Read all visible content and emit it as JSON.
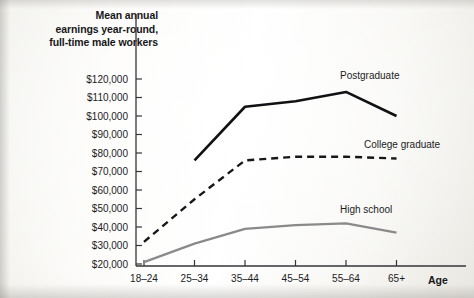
{
  "chart_data": {
    "type": "line",
    "title": "Mean annual earnings year-round, full-time male workers",
    "title_lines": [
      "Mean annual",
      "earnings year-round,",
      "full-time male workers"
    ],
    "xlabel": "Age",
    "ylabel": "",
    "categories": [
      "18–24",
      "25–34",
      "35–44",
      "45–54",
      "55–64",
      "65+"
    ],
    "ytick_labels": [
      "$120,000",
      "$110,000",
      "$100,000",
      "$90,000",
      "$80,000",
      "$70,000",
      "$60,000",
      "$50,000",
      "$40,000",
      "$30,000",
      "$20,000"
    ],
    "ytick_values": [
      120000,
      110000,
      100000,
      90000,
      80000,
      70000,
      60000,
      50000,
      40000,
      30000,
      20000
    ],
    "ylim": [
      20000,
      120000
    ],
    "grid": false,
    "legend_position": "inline-labels",
    "series": [
      {
        "name": "Postgraduate",
        "style": "solid",
        "color": "#111114",
        "width": 2.6,
        "values": [
          null,
          76000,
          105000,
          108000,
          113000,
          100000
        ]
      },
      {
        "name": "College graduate",
        "style": "dashed",
        "color": "#17171a",
        "width": 2.4,
        "values": [
          32000,
          55000,
          76000,
          78000,
          78000,
          77000
        ]
      },
      {
        "name": "High school",
        "style": "solid",
        "color": "#8a8a8a",
        "width": 2.2,
        "values": [
          21000,
          31000,
          39000,
          41000,
          42000,
          37000
        ]
      }
    ]
  },
  "axis": {
    "x_axis_name": "Age"
  }
}
